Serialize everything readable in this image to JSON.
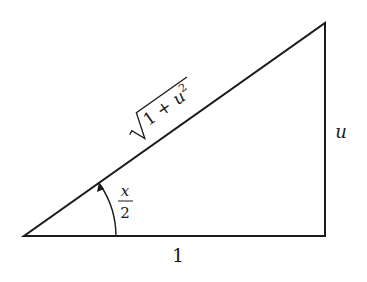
{
  "diagram": {
    "type": "right-triangle",
    "vertices": {
      "A": [
        24,
        236
      ],
      "B": [
        325,
        236
      ],
      "C": [
        325,
        23
      ]
    },
    "labels": {
      "hypotenuse": "√(1 + u²)",
      "hyp_radicand_1": "1 + ",
      "hyp_radicand_u": "u",
      "hyp_exp": "2",
      "vertical_side": "u",
      "base_side": "1",
      "angle_num": "x",
      "angle_den": "2"
    },
    "angle": {
      "vertex": "A",
      "value": "x/2",
      "arrow": "counterclockwise"
    },
    "stroke_color": "#1a1a1a",
    "background": "#ffffff"
  }
}
